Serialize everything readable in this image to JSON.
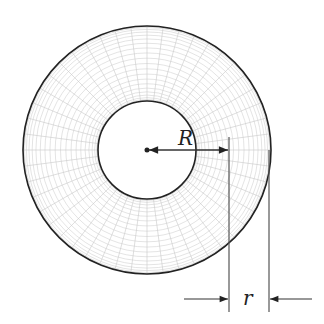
{
  "diagram": {
    "type": "torus-top-view",
    "labels": {
      "major_radius": "R",
      "minor_radius": "r"
    },
    "geometry": {
      "center": [
        147,
        150
      ],
      "outer_radius": 124,
      "inner_radius": 49,
      "tube_center_radius": 81
    },
    "colors": {
      "outline": "#222222",
      "mesh": "#c8c8c8",
      "dimension": "#333333"
    }
  }
}
